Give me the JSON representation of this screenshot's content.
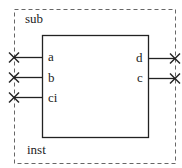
{
  "diagram": {
    "outer_label": "sub",
    "instance_label": "inst",
    "colors": {
      "stroke": "#222222",
      "dashed": "#666666",
      "background": "#ffffff"
    },
    "left_ports": [
      {
        "name": "a"
      },
      {
        "name": "b"
      },
      {
        "name": "ci"
      }
    ],
    "right_ports": [
      {
        "name": "d"
      },
      {
        "name": "c"
      }
    ],
    "unconnected_marker": "x-icon"
  }
}
